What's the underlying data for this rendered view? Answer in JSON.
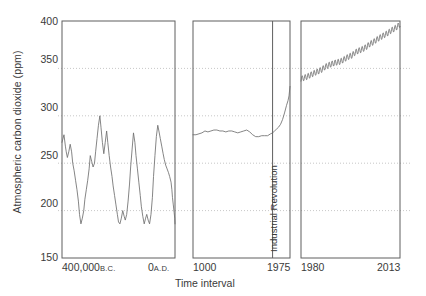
{
  "chart_data": {
    "type": "line",
    "title": "",
    "xlabel": "Time interval",
    "ylabel": "Atmospheric carbon dioxide (ppm)",
    "ylim": [
      150,
      400
    ],
    "yticks": [
      150,
      200,
      250,
      300,
      350,
      400
    ],
    "grid": "horizontal-dotted",
    "legend": "none",
    "panels": [
      {
        "name": "ice-core-record",
        "xlim_label_left": "400,000",
        "xlim_era_left": "B.C.",
        "xlim_label_right": "0",
        "xlim_era_right": "A.D.",
        "x": [
          400000,
          393000,
          388000,
          385000,
          381000,
          376000,
          371000,
          366000,
          362000,
          357000,
          352000,
          347000,
          342000,
          338000,
          333000,
          328000,
          323000,
          319000,
          314000,
          309000,
          304000,
          300000,
          295000,
          290000,
          285000,
          281000,
          276000,
          271000,
          266000,
          262000,
          257000,
          252000,
          247000,
          242000,
          238000,
          233000,
          228000,
          223000,
          219000,
          214000,
          209000,
          204000,
          200000,
          195000,
          190000,
          185000,
          180000,
          176000,
          171000,
          166000,
          161000,
          157000,
          152000,
          147000,
          142000,
          138000,
          133000,
          128000,
          123000,
          119000,
          114000,
          109000,
          104000,
          100000,
          95000,
          90000,
          85000,
          80000,
          76000,
          71000,
          66000,
          61000,
          57000,
          52000,
          47000,
          42000,
          38000,
          33000,
          28000,
          23000,
          19000,
          14000,
          11000,
          9000,
          6000,
          3000,
          1000,
          0
        ],
        "values": [
          272,
          280,
          268,
          262,
          256,
          262,
          270,
          262,
          250,
          242,
          232,
          222,
          210,
          196,
          186,
          192,
          200,
          212,
          222,
          232,
          244,
          258,
          252,
          246,
          250,
          262,
          276,
          290,
          300,
          288,
          272,
          260,
          272,
          284,
          272,
          258,
          246,
          236,
          226,
          216,
          206,
          196,
          188,
          186,
          192,
          200,
          194,
          190,
          196,
          210,
          228,
          246,
          264,
          282,
          272,
          258,
          244,
          230,
          216,
          204,
          194,
          186,
          192,
          196,
          190,
          186,
          196,
          214,
          236,
          258,
          278,
          290,
          284,
          276,
          268,
          260,
          254,
          248,
          244,
          240,
          236,
          230,
          222,
          214,
          206,
          198,
          192,
          186
        ],
        "units": "ppm"
      },
      {
        "name": "millennium-record",
        "xlim_label_left": "1000",
        "xlim_label_right": "1975",
        "annotation": "Industrial Revolution",
        "annotation_x": 1800,
        "x": [
          1000,
          1030,
          1060,
          1090,
          1120,
          1150,
          1180,
          1210,
          1240,
          1270,
          1300,
          1330,
          1360,
          1390,
          1420,
          1450,
          1480,
          1510,
          1540,
          1570,
          1600,
          1630,
          1660,
          1690,
          1720,
          1750,
          1780,
          1800,
          1820,
          1840,
          1860,
          1880,
          1900,
          1920,
          1940,
          1955,
          1965,
          1975
        ],
        "values": [
          280,
          280,
          281,
          282,
          284,
          283,
          284,
          285,
          285,
          284,
          284,
          283,
          284,
          284,
          283,
          282,
          283,
          284,
          285,
          283,
          280,
          278,
          278,
          279,
          279,
          279,
          281,
          282,
          284,
          286,
          288,
          291,
          296,
          303,
          311,
          316,
          321,
          331
        ],
        "units": "ppm"
      },
      {
        "name": "keeling-curve",
        "xlim_label_left": "1980",
        "xlim_label_right": "2013",
        "x": [
          1980,
          1981,
          1982,
          1983,
          1984,
          1985,
          1986,
          1987,
          1988,
          1989,
          1990,
          1991,
          1992,
          1993,
          1994,
          1995,
          1996,
          1997,
          1998,
          1999,
          2000,
          2001,
          2002,
          2003,
          2004,
          2005,
          2006,
          2007,
          2008,
          2009,
          2010,
          2011,
          2012,
          2013
        ],
        "values": [
          338.7,
          340.1,
          341.2,
          342.8,
          344.4,
          345.9,
          347.2,
          348.9,
          351.5,
          353.1,
          354.4,
          355.6,
          356.4,
          357.1,
          358.8,
          360.8,
          362.6,
          363.7,
          366.7,
          368.4,
          369.6,
          371.1,
          373.2,
          375.8,
          377.5,
          379.8,
          381.9,
          383.8,
          385.6,
          387.4,
          389.9,
          391.6,
          393.8,
          396.5
        ],
        "seasonal_amplitude_ppm": 6.0,
        "units": "ppm"
      }
    ]
  }
}
